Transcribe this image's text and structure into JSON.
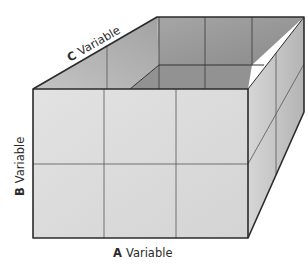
{
  "diagram": {
    "type": "three-way factorial design box (2 x 3 x 2 cube)",
    "axes": {
      "a": {
        "letter": "A",
        "word": "Variable",
        "levels": 3
      },
      "b": {
        "letter": "B",
        "word": "Variable",
        "levels": 2
      },
      "c": {
        "letter": "C",
        "word": "Variable",
        "levels": 2
      }
    },
    "colors": {
      "front_face": "#dcdcdc",
      "top_interior": "#9a9a9a",
      "back_wall": "#8c8c8c",
      "left_interior": "#b0b0b0",
      "right_side": "#c8c8c8",
      "edge": "#2b2b2b",
      "grid": "#555555"
    }
  }
}
